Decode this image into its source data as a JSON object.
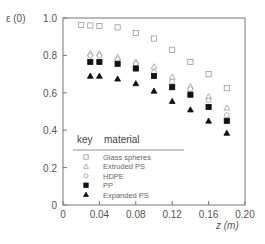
{
  "chart_data": {
    "type": "scatter",
    "title": "",
    "xlabel": "z (m)",
    "ylabel": "ε (0)",
    "xlim": [
      0,
      0.2
    ],
    "ylim": [
      0,
      1.0
    ],
    "xticks": [
      "0",
      "0.04",
      "0.08",
      "0.12",
      "0.16",
      "0.20"
    ],
    "yticks": [
      "0",
      "0.2",
      "0.4",
      "0.6",
      "0.8",
      "1.0"
    ],
    "grid": false,
    "legend": {
      "position": "lower left inside",
      "header_key": "key",
      "header_material": "material"
    },
    "series": [
      {
        "name": "Glass spheres",
        "marker": "open-square",
        "x": [
          0.02,
          0.03,
          0.04,
          0.06,
          0.08,
          0.1,
          0.12,
          0.14,
          0.16,
          0.18
        ],
        "y": [
          0.963,
          0.96,
          0.957,
          0.95,
          0.92,
          0.89,
          0.83,
          0.765,
          0.7,
          0.625
        ]
      },
      {
        "name": "Extruded PS",
        "marker": "open-triangle",
        "x": [
          0.03,
          0.04,
          0.06,
          0.08,
          0.1,
          0.12,
          0.14,
          0.16,
          0.18
        ],
        "y": [
          0.81,
          0.81,
          0.79,
          0.765,
          0.74,
          0.685,
          0.635,
          0.58,
          0.52
        ]
      },
      {
        "name": "HDPE",
        "marker": "open-circle",
        "x": [
          0.03,
          0.04,
          0.06,
          0.08,
          0.1,
          0.12,
          0.14,
          0.16,
          0.18
        ],
        "y": [
          0.8,
          0.8,
          0.78,
          0.755,
          0.71,
          0.66,
          0.62,
          0.56,
          0.48
        ]
      },
      {
        "name": "PP",
        "marker": "filled-square",
        "x": [
          0.03,
          0.04,
          0.06,
          0.08,
          0.1,
          0.12,
          0.14,
          0.16,
          0.18
        ],
        "y": [
          0.765,
          0.765,
          0.755,
          0.73,
          0.69,
          0.63,
          0.59,
          0.524,
          0.45
        ]
      },
      {
        "name": "Expanded PS",
        "marker": "filled-triangle",
        "x": [
          0.03,
          0.04,
          0.06,
          0.08,
          0.1,
          0.12,
          0.14,
          0.16,
          0.18
        ],
        "y": [
          0.69,
          0.69,
          0.675,
          0.65,
          0.61,
          0.555,
          0.51,
          0.45,
          0.385
        ]
      }
    ]
  },
  "colors": {
    "axis": "#777777",
    "open_marker": "#999999",
    "filled_marker": "#111111"
  }
}
